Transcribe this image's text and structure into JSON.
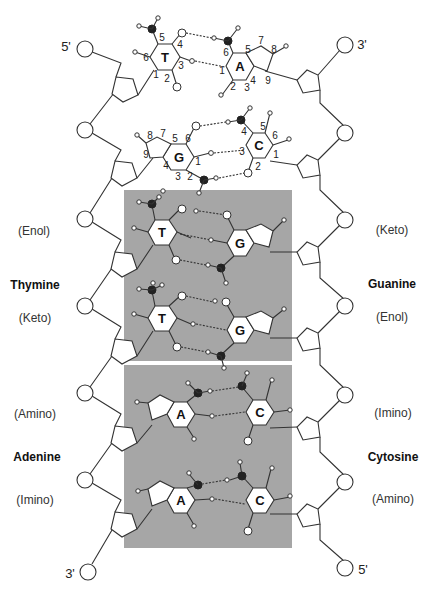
{
  "figure": {
    "type": "DNA double helix tautomeric base pair mispairing diagram",
    "strand_ends": {
      "top_left": "5'",
      "top_right": "3'",
      "bottom_left": "3'",
      "bottom_right": "5'"
    },
    "labels": {
      "left": [
        {
          "text": "(Enol)",
          "style": "normal"
        },
        {
          "text": "Thymine",
          "style": "bold"
        },
        {
          "text": "(Keto)",
          "style": "normal"
        },
        {
          "text": "(Amino)",
          "style": "normal"
        },
        {
          "text": "Adenine",
          "style": "bold"
        },
        {
          "text": "(Imino)",
          "style": "normal"
        }
      ],
      "right": [
        {
          "text": "(Keto)",
          "style": "normal"
        },
        {
          "text": "Guanine",
          "style": "bold"
        },
        {
          "text": "(Enol)",
          "style": "normal"
        },
        {
          "text": "(Imino)",
          "style": "normal"
        },
        {
          "text": "Cytosine",
          "style": "bold"
        },
        {
          "text": "(Amino)",
          "style": "normal"
        }
      ]
    },
    "base_pairs": [
      {
        "left": "T",
        "right": "A",
        "shaded": false,
        "left_numbers": [
          "5",
          "4",
          "6",
          "3",
          "1",
          "2"
        ],
        "right_numbers": [
          "6",
          "7",
          "5",
          "8",
          "1",
          "A",
          "4",
          "9",
          "2",
          "3"
        ]
      },
      {
        "left": "G",
        "right": "C",
        "shaded": false,
        "left_numbers": [
          "8",
          "7",
          "5",
          "6",
          "9",
          "4",
          "1",
          "3",
          "2"
        ],
        "right_numbers": [
          "4",
          "5",
          "6",
          "3",
          "1",
          "2"
        ]
      },
      {
        "left": "T",
        "right": "G",
        "shaded": true
      },
      {
        "left": "T",
        "right": "G",
        "shaded": true
      },
      {
        "left": "A",
        "right": "C",
        "shaded": true
      },
      {
        "left": "A",
        "right": "C",
        "shaded": true
      }
    ],
    "colors": {
      "shade": "#a6a6a6",
      "line": "#333333",
      "atom_dark": "#222222",
      "atom_light": "#ffffff"
    }
  }
}
